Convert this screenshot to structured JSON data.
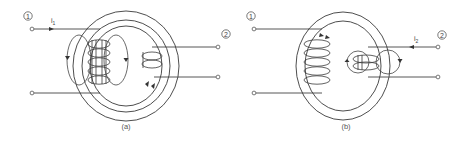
{
  "figure": {
    "panel_a": {
      "caption": "(a)",
      "port1_label": "1",
      "port2_label": "2",
      "current_label": "i",
      "current_subscript": "1",
      "description": "Flux produced by current i1 in coil 1 on toroidal core"
    },
    "panel_b": {
      "caption": "(b)",
      "port1_label": "1",
      "port2_label": "2",
      "current_label": "i",
      "current_subscript": "2",
      "description": "Flux produced by current i2 in coil 2 on toroidal core"
    },
    "colors": {
      "line": "#444444",
      "background": "#ffffff"
    }
  }
}
